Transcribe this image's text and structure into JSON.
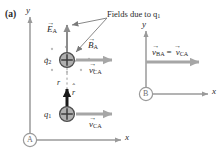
{
  "figure": {
    "panel_label": "(a)",
    "caption": "Fields due to q",
    "caption_sub": "1",
    "colors": {
      "axis": "#9a9a9a",
      "velocity_arrow": "#a6a6a6",
      "field_arrow": "#8c8c8c",
      "unit_vector": "#1a1a1a",
      "charge_fill": "#b0b0b0",
      "charge_stroke": "#4d4d4d",
      "text": "#2a2a2a",
      "leader": "#7a7a7a",
      "dot": "#b8b8b8",
      "background": "#ffffff"
    }
  },
  "frame_a": {
    "origin_label": "A",
    "x_axis_label": "x",
    "y_axis_label": "y",
    "charges": [
      {
        "name": "q",
        "sub": "2",
        "sign": "+"
      },
      {
        "name": "q",
        "sub": "1",
        "sign": "+"
      }
    ],
    "separation_label": "r",
    "unit_vector_label": "r",
    "field_vectors": [
      {
        "name": "E",
        "sub": "A",
        "direction": "up"
      },
      {
        "name": "B",
        "sub": "A",
        "direction": "into-page-dots"
      }
    ],
    "velocity_top": {
      "name": "v",
      "sub": "CA"
    },
    "velocity_bottom": {
      "name": "v",
      "sub": "CA"
    }
  },
  "frame_b": {
    "origin_label": "B",
    "x_axis_label": "x",
    "y_axis_label": "y",
    "velocity_left": {
      "name": "v",
      "sub": "BA"
    },
    "equals": "=",
    "velocity_right": {
      "name": "v",
      "sub": "CA"
    }
  }
}
